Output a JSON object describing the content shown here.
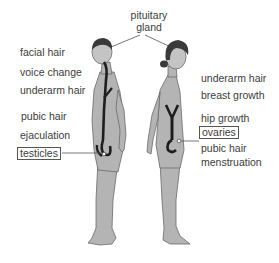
{
  "diagram": {
    "title_label": {
      "line1": "pituitary",
      "line2": "gland"
    },
    "male": {
      "labels": [
        "facial hair",
        "voice change",
        "underarm hair",
        "pubic hair",
        "ejaculation"
      ],
      "boxed_label": "testicles"
    },
    "female": {
      "labels": [
        "underarm hair",
        "breast growth",
        "hip growth"
      ],
      "boxed_label": "ovaries",
      "labels_below": [
        "pubic hair",
        "menstruation"
      ]
    },
    "colors": {
      "body_fill": "#b4b4b4",
      "body_outline": "#6a6a6a",
      "hair": "#3a3a3a",
      "organ": "#1e1e1e",
      "text": "#3c3c3c"
    }
  }
}
